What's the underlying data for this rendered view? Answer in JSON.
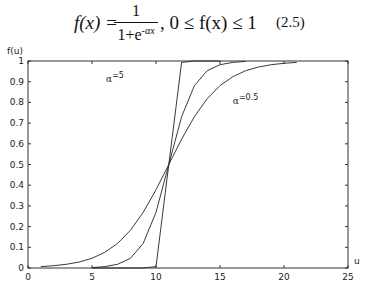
{
  "formula": {
    "lhs": "f(x) =",
    "numerator": "1",
    "denominator_base": "1+e",
    "denominator_exp": "-αx",
    "condition": ", 0 ≤ f(x) ≤ 1",
    "equation_number": "(2.5)"
  },
  "chart_data": {
    "type": "line",
    "title": "",
    "xlabel": "u",
    "ylabel": "f(u)",
    "xlim": [
      0,
      25
    ],
    "ylim": [
      0,
      1
    ],
    "grid": false,
    "legend": "none",
    "x_ticks": [
      0,
      5,
      10,
      15,
      20,
      25
    ],
    "x_tick_labels": [
      "0",
      "5",
      "10",
      "15",
      "20",
      "25"
    ],
    "y_ticks": [
      0,
      0.1,
      0.2,
      0.3,
      0.4,
      0.5,
      0.6,
      0.7,
      0.8,
      0.9,
      1
    ],
    "y_tick_labels": [
      "0",
      "0.1",
      "0.2",
      "0.3",
      "0.4",
      "0.5",
      "0.6",
      "0.7",
      "0.8",
      "0.9",
      "1"
    ],
    "series": [
      {
        "name": "α=5",
        "x": [
          5,
          6,
          7,
          8,
          9,
          10,
          11,
          12,
          13,
          14,
          15
        ],
        "y": [
          0.0,
          0.0,
          0.0,
          0.0,
          0.0,
          0.007,
          0.5,
          0.993,
          1.0,
          1.0,
          1.0
        ]
      },
      {
        "name": "α=1",
        "x": [
          5,
          6,
          7,
          8,
          9,
          10,
          11,
          12,
          13,
          14,
          15,
          16,
          17
        ],
        "y": [
          0.002,
          0.007,
          0.018,
          0.047,
          0.119,
          0.269,
          0.5,
          0.731,
          0.881,
          0.953,
          0.982,
          0.993,
          0.998
        ]
      },
      {
        "name": "α=0.5",
        "x": [
          1,
          2,
          3,
          4,
          5,
          6,
          7,
          8,
          9,
          10,
          11,
          12,
          13,
          14,
          15,
          16,
          17,
          18,
          19,
          20,
          21
        ],
        "y": [
          0.007,
          0.011,
          0.018,
          0.029,
          0.047,
          0.076,
          0.119,
          0.182,
          0.269,
          0.378,
          0.5,
          0.622,
          0.731,
          0.818,
          0.881,
          0.924,
          0.953,
          0.971,
          0.982,
          0.989,
          0.993
        ]
      }
    ],
    "annotations": [
      {
        "text": "α",
        "sup": "=5",
        "x": 6.1,
        "y": 0.9
      },
      {
        "text": "α",
        "sup": "=0.5",
        "x": 16.0,
        "y": 0.79
      }
    ]
  }
}
